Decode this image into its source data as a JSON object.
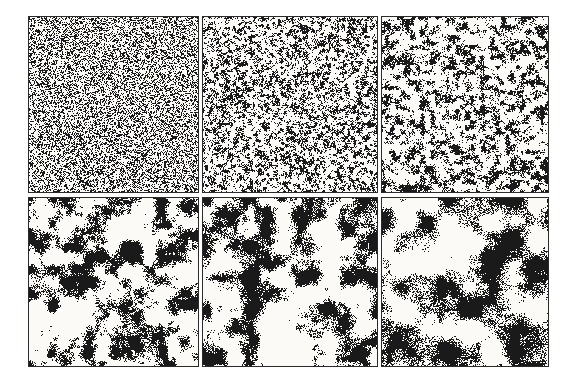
{
  "figure": {
    "name": "phase-ordering-simulation-snapshots",
    "layout": {
      "rows": 2,
      "cols": 3
    },
    "colors": {
      "page_background": "#ffffff",
      "panel_paper": "#fbfaf7",
      "ink": "#1a1a1a",
      "panel_border": "#2b2b2b"
    },
    "panels": [
      {
        "name": "snapshot-1-fine-random-speckle",
        "row": 1,
        "col": 1,
        "seed": 101,
        "coarseness_px": 1.4,
        "detail": 0.5,
        "edge_grain": 2.0,
        "black_fraction": 0.38
      },
      {
        "name": "snapshot-2-small-clusters",
        "row": 1,
        "col": 2,
        "seed": 202,
        "coarseness_px": 2.8,
        "detail": 0.6,
        "edge_grain": 0.7,
        "black_fraction": 0.35
      },
      {
        "name": "snapshot-3-wormy-clusters",
        "row": 1,
        "col": 3,
        "seed": 303,
        "coarseness_px": 5.0,
        "detail": 0.6,
        "edge_grain": 0.55,
        "black_fraction": 0.34
      },
      {
        "name": "snapshot-4-connected-domains",
        "row": 2,
        "col": 1,
        "seed": 404,
        "coarseness_px": 12.0,
        "detail": 0.45,
        "edge_grain": 0.42,
        "black_fraction": 0.36
      },
      {
        "name": "snapshot-5-coarser-domains",
        "row": 2,
        "col": 2,
        "seed": 505,
        "coarseness_px": 16.0,
        "detail": 0.4,
        "edge_grain": 0.4,
        "black_fraction": 0.38
      },
      {
        "name": "snapshot-6-coarsest-domains",
        "row": 2,
        "col": 3,
        "seed": 606,
        "coarseness_px": 22.0,
        "detail": 0.35,
        "edge_grain": 0.38,
        "black_fraction": 0.4
      }
    ]
  }
}
